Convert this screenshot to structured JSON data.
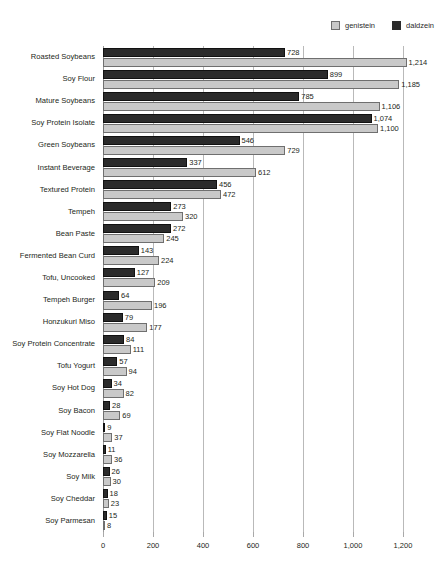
{
  "chart_data": {
    "type": "bar",
    "orientation": "horizontal",
    "title": "",
    "subtitle": "",
    "xlabel": "",
    "ylabel": "",
    "xlim": [
      0,
      1200
    ],
    "xticks": [
      "0",
      "200",
      "400",
      "600",
      "800",
      "1,000",
      "1,200"
    ],
    "xtick_values": [
      0,
      200,
      400,
      600,
      800,
      1000,
      1200
    ],
    "grid": "vertical",
    "legend_position": "top-right",
    "categories": [
      "Roasted Soybeans",
      "Soy Flour",
      "Mature Soybeans",
      "Soy Protein Isolate",
      "Green Soybeans",
      "Instant Beverage",
      "Textured Protein",
      "Tempeh",
      "Bean Paste",
      "Fermented Bean Curd",
      "Tofu, Uncooked",
      "Tempeh Burger",
      "Honzukuri Miso",
      "Soy Protein Concentrate",
      "Tofu Yogurt",
      "Soy Hot Dog",
      "Soy Bacon",
      "Soy Flat Noodle",
      "Soy Mozzarella",
      "Soy Milk",
      "Soy Cheddar",
      "Soy Parmesan"
    ],
    "series": [
      {
        "name": "daldzein",
        "color": "#2b2b2b",
        "values": [
          728,
          899,
          785,
          1074,
          546,
          337,
          456,
          273,
          272,
          143,
          127,
          64,
          79,
          84,
          57,
          34,
          28,
          9,
          11,
          26,
          18,
          15
        ],
        "labels": [
          "728",
          "899",
          "785",
          "1,074",
          "546",
          "337",
          "456",
          "273",
          "272",
          "143",
          "127",
          "64",
          "79",
          "84",
          "57",
          "34",
          "28",
          "9",
          "11",
          "26",
          "18",
          "15"
        ]
      },
      {
        "name": "genistein",
        "color": "#c9c9c9",
        "values": [
          1214,
          1185,
          1106,
          1100,
          729,
          612,
          472,
          320,
          245,
          224,
          209,
          196,
          177,
          111,
          94,
          82,
          69,
          37,
          36,
          30,
          23,
          8
        ],
        "labels": [
          "1,214",
          "1,185",
          "1,106",
          "1,100",
          "729",
          "612",
          "472",
          "320",
          "245",
          "224",
          "209",
          "196",
          "177",
          "111",
          "94",
          "82",
          "69",
          "37",
          "36",
          "30",
          "23",
          "8"
        ]
      }
    ]
  },
  "legend": {
    "entries": [
      {
        "label": "genistein",
        "color": "#c9c9c9"
      },
      {
        "label": "daldzein",
        "color": "#2b2b2b"
      }
    ]
  },
  "colors": {
    "genistein": "#c9c9c9",
    "daldzein": "#2b2b2b",
    "gridline": "#b9b9b9",
    "text": "#231f20",
    "background": "#ffffff"
  }
}
